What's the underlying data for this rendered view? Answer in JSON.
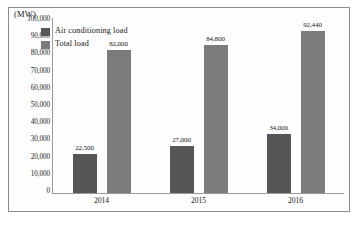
{
  "chart_data": {
    "type": "bar",
    "title": "",
    "xlabel": "",
    "ylabel": "(MW)",
    "unit_caption": "(MW)",
    "categories": [
      "2014",
      "2015",
      "2016"
    ],
    "series": [
      {
        "name": "Air conditioning load",
        "color": "#565656",
        "values": [
          22500,
          27000,
          34000
        ],
        "value_labels": [
          "22,500",
          "27,000",
          "34,000"
        ]
      },
      {
        "name": "Total load",
        "color": "#7b7b7b",
        "values": [
          82000,
          84800,
          92440
        ],
        "value_labels": [
          "82,000",
          "84,800",
          "92,440"
        ]
      }
    ],
    "ylim": [
      0,
      100000
    ],
    "ytick_step": 10000,
    "ytick_labels": [
      "100,000",
      "90,000",
      "80,000",
      "70,000",
      "60,000",
      "50,000",
      "40,000",
      "30,000",
      "20,000",
      "10,000",
      "0"
    ],
    "ytick_values": [
      100000,
      90000,
      80000,
      70000,
      60000,
      50000,
      40000,
      30000,
      20000,
      10000,
      0
    ],
    "grid": false,
    "legend_position": "top-left",
    "legend": [
      {
        "label": "Air conditioning load",
        "color": "#565656"
      },
      {
        "label": "Total load",
        "color": "#7b7b7b"
      }
    ],
    "border_color": "#8c8c8c",
    "axis_color": "#9a9a9a",
    "background": "#fdfdfd"
  }
}
